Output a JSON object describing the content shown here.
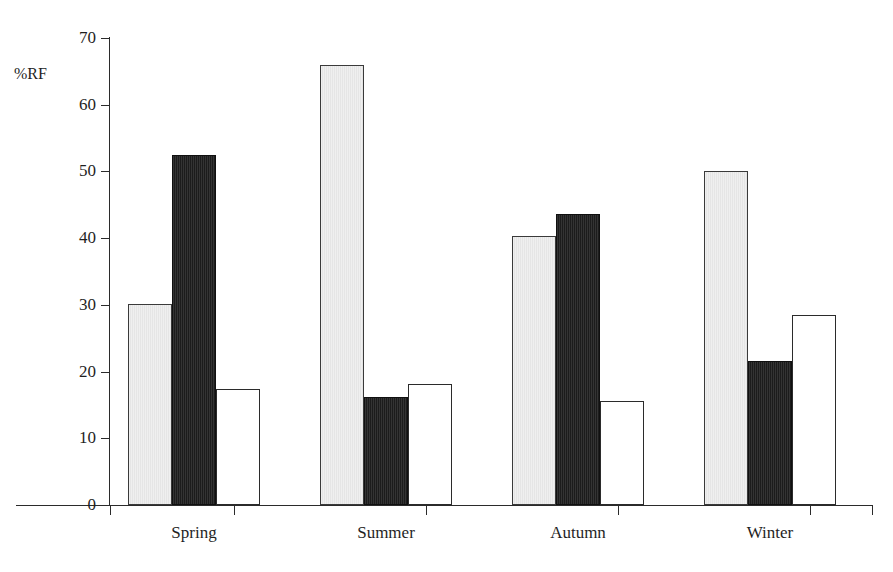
{
  "figure": {
    "clipped_title_sliver": "",
    "background_color": "#ffffff",
    "axis_color": "#2b2b2b"
  },
  "axes": {
    "y_axis_title": "%RF",
    "y_ticks": [
      0,
      10,
      20,
      30,
      40,
      50,
      60,
      70
    ],
    "y_tick_labels": [
      "0",
      "10",
      "20",
      "30",
      "40",
      "50",
      "60",
      "70"
    ],
    "x_categories": [
      "Spring",
      "Summer",
      "Autumn",
      "Winter"
    ]
  },
  "chart_data": {
    "type": "bar",
    "title": "",
    "xlabel": "",
    "ylabel": "%RF",
    "ylim": [
      0,
      70
    ],
    "ytick_step": 10,
    "grid": false,
    "legend": false,
    "legend_position": "none",
    "categories": [
      "Spring",
      "Summer",
      "Autumn",
      "Winter"
    ],
    "series": [
      {
        "name": "Series 1",
        "fill": "#ededed",
        "edge": "#3a3a3a",
        "style": "light-grey",
        "values": [
          30.2,
          66.0,
          40.3,
          50.0
        ]
      },
      {
        "name": "Series 2",
        "fill": "#1d1d1d",
        "edge": "#101010",
        "style": "black",
        "values": [
          52.4,
          16.2,
          43.6,
          21.6
        ]
      },
      {
        "name": "Series 3",
        "fill": "#ffffff",
        "edge": "#2b2b2b",
        "style": "white-outline",
        "values": [
          17.4,
          18.2,
          15.6,
          28.5
        ]
      }
    ],
    "units": "percent"
  },
  "colors": {
    "light": "#ededed",
    "dark": "#1d1d1d",
    "white": "#ffffff",
    "axis": "#2b2b2b",
    "text": "#1f1f1f"
  }
}
